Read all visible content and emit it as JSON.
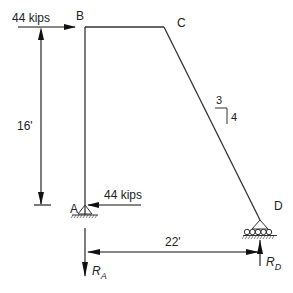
{
  "diagram": {
    "nodes": {
      "A": "A",
      "B": "B",
      "C": "C",
      "D": "D"
    },
    "loads": {
      "top_load": "44 kips",
      "base_load": "44 kips"
    },
    "dimensions": {
      "height": "16'",
      "span": "22'"
    },
    "slope": {
      "rise_label": "3",
      "run_label": "4"
    },
    "reactions": {
      "RA_main": "R",
      "RA_sub": "A",
      "RD_main": "R",
      "RD_sub": "D"
    },
    "colors": {
      "line": "#333333",
      "text": "#222222"
    }
  }
}
